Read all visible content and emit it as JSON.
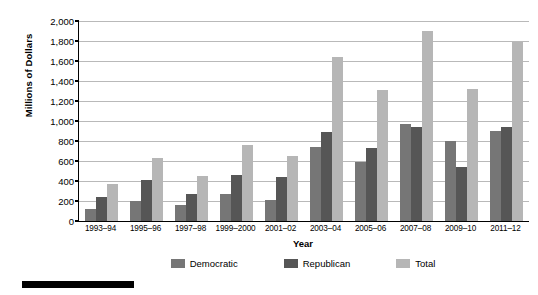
{
  "chart_data": {
    "type": "bar",
    "title": "",
    "xlabel": "Year",
    "ylabel": "Millions of Dollars",
    "ylim": [
      0,
      2000
    ],
    "ytick_step": 200,
    "grid": true,
    "legend_position": "bottom",
    "categories": [
      "1993–94",
      "1995–96",
      "1997–98",
      "1999–2000",
      "2001–02",
      "2003–04",
      "2005–06",
      "2007–08",
      "2009–10",
      "2011–12"
    ],
    "yticks": [
      "0",
      "200",
      "400",
      "600",
      "800",
      "1,000",
      "1,200",
      "1,400",
      "1,600",
      "1,800",
      "2,000"
    ],
    "series": [
      {
        "name": "Democratic",
        "color": "#767676",
        "values": [
          120,
          205,
          165,
          275,
          215,
          745,
          590,
          975,
          800,
          900
        ]
      },
      {
        "name": "Republican",
        "color": "#565656",
        "values": [
          245,
          410,
          275,
          465,
          445,
          890,
          735,
          945,
          545,
          940
        ]
      },
      {
        "name": "Total",
        "color": "#b6b6b6",
        "values": [
          370,
          635,
          450,
          765,
          655,
          1640,
          1310,
          1900,
          1320,
          1790
        ]
      }
    ]
  },
  "legend": {
    "items": [
      {
        "label": "Democratic"
      },
      {
        "label": "Republican"
      },
      {
        "label": "Total"
      }
    ]
  }
}
